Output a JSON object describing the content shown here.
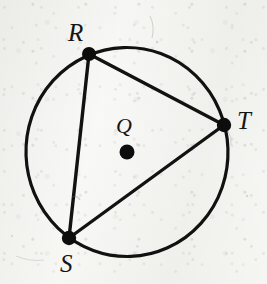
{
  "figure": {
    "kind": "circle-geometry-diagram",
    "width": 267,
    "height": 284,
    "background_color": "#f4f4f2",
    "ink_color": "#101010"
  },
  "circle": {
    "name": "circle-Q",
    "center_label": "Q",
    "cx": 127,
    "cy": 152,
    "r": 101,
    "stroke_width": 3.2,
    "stroke_color": "#111111"
  },
  "center_point": {
    "label": "Q",
    "x": 127,
    "y": 152,
    "dot_radius": 7.5,
    "label_x": 123,
    "label_y": 127
  },
  "points": [
    {
      "label": "R",
      "x": 89,
      "y": 54,
      "dot_radius": 7.0,
      "label_x": 76,
      "label_y": 32
    },
    {
      "label": "T",
      "x": 224,
      "y": 125,
      "dot_radius": 7.2,
      "label_x": 245,
      "label_y": 120
    },
    {
      "label": "S",
      "x": 69,
      "y": 238,
      "dot_radius": 7.2,
      "label_x": 68,
      "label_y": 263
    }
  ],
  "chords": [
    {
      "name": "chord-RT",
      "from": "R",
      "to": "T",
      "x1": 89,
      "y1": 54,
      "x2": 224,
      "y2": 125,
      "stroke_width": 3.4
    },
    {
      "name": "chord-RS",
      "from": "R",
      "to": "S",
      "x1": 89,
      "y1": 54,
      "x2": 69,
      "y2": 238,
      "stroke_width": 3.4
    },
    {
      "name": "chord-ST",
      "from": "S",
      "to": "T",
      "x1": 69,
      "y1": 238,
      "x2": 224,
      "y2": 125,
      "stroke_width": 3.4
    }
  ],
  "labels": {
    "R": "R",
    "S": "S",
    "T": "T",
    "Q": "Q"
  }
}
